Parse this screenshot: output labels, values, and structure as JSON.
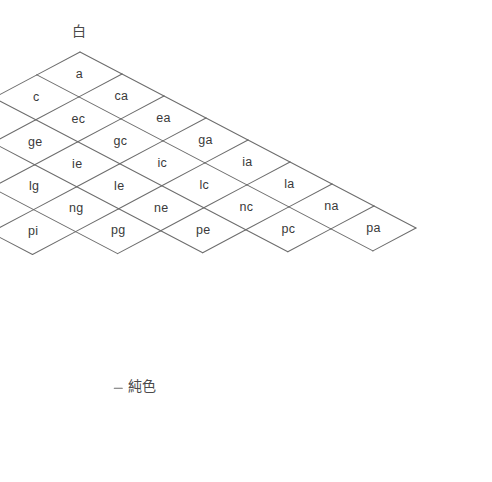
{
  "diagram": {
    "type": "ostwald-color-triangle",
    "labels": {
      "white": "白",
      "black": "黒",
      "pure": "純色"
    },
    "geometry": {
      "apex_x": 80,
      "apex_y": 52,
      "cell_half_width": 42,
      "cell_half_height": 22,
      "rows": 8,
      "total_cells": 36,
      "line_color": "#6d6d6d",
      "text_color": "#3a3a3a",
      "background": "#ffffff"
    },
    "columns": [
      {
        "index": 0,
        "cells": [
          "a",
          "c",
          "e",
          "g",
          "i",
          "l",
          "n",
          "p"
        ]
      },
      {
        "index": 1,
        "cells": [
          "ca",
          "ec",
          "ge",
          "ig",
          "li",
          "nl",
          "pn"
        ]
      },
      {
        "index": 2,
        "cells": [
          "ea",
          "gc",
          "ie",
          "lg",
          "ni",
          "pl"
        ]
      },
      {
        "index": 3,
        "cells": [
          "ga",
          "ic",
          "le",
          "ng",
          "pi"
        ]
      },
      {
        "index": 4,
        "cells": [
          "ia",
          "lc",
          "ne",
          "pg"
        ]
      },
      {
        "index": 5,
        "cells": [
          "la",
          "nc",
          "pe"
        ]
      },
      {
        "index": 6,
        "cells": [
          "na",
          "pc"
        ]
      },
      {
        "index": 7,
        "cells": [
          "pa"
        ]
      }
    ]
  }
}
